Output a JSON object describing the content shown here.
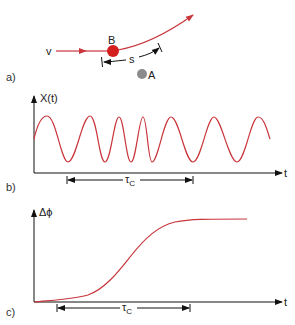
{
  "colors": {
    "curve": "#c8353a",
    "particle_b": "#d41f1f",
    "particle_a": "#8c8c8c",
    "axis": "#111111"
  },
  "panel_a": {
    "label": "a)",
    "velocity_label": "v",
    "particle_b_label": "B",
    "particle_a_label": "A",
    "distance_label": "s"
  },
  "panel_b": {
    "label": "b)",
    "y_axis_label": "X(t)",
    "x_axis_label": "t",
    "interval_label": "τ",
    "interval_subscript": "C"
  },
  "panel_c": {
    "label": "c)",
    "y_axis_label": "Δϕ",
    "x_axis_label": "t",
    "interval_label": "τ",
    "interval_subscript": "C"
  }
}
